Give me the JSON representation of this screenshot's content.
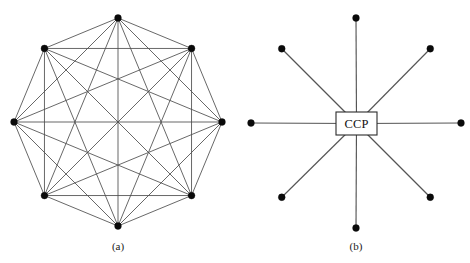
{
  "figure": {
    "width": 470,
    "height": 263,
    "background_color": "#ffffff",
    "edge_color": "#4d4d4d",
    "node_color": "#0a0a0a",
    "label_color": "#1a1a1a",
    "panels": [
      {
        "id": "panel-a",
        "caption": "(a)",
        "caption_x": 118,
        "caption_y": 247,
        "topology": "fully-connected-mesh",
        "center_x": 118,
        "center_y": 122,
        "radius": 104,
        "node_count": 8,
        "node_radius": 3.4,
        "start_angle_deg": -90,
        "edges": "all-pairs"
      },
      {
        "id": "panel-b",
        "caption": "(b)",
        "caption_x": 356,
        "caption_y": 247,
        "topology": "star-hub-and-spoke",
        "center_x": 356,
        "center_y": 123,
        "radius": 105,
        "node_count": 8,
        "node_radius": 3.4,
        "start_angle_deg": -90,
        "hub": {
          "label": "CCP",
          "x": 336,
          "y": 112,
          "width": 41,
          "height": 23
        }
      }
    ]
  },
  "chart_data": {
    "type": "diagram",
    "title": "",
    "subtitle": "",
    "panels": [
      {
        "name": "(a)",
        "description": "Fully connected mesh network of eight counterparties",
        "nodes": 8,
        "edges": 28,
        "node_labels": [
          "",
          "",
          "",
          "",
          "",
          "",
          "",
          ""
        ]
      },
      {
        "name": "(b)",
        "description": "Star network with a central counterparty clearing hub",
        "nodes": 8,
        "edges": 8,
        "hub_label": "CCP",
        "node_labels": [
          "",
          "",
          "",
          "",
          "",
          "",
          "",
          ""
        ]
      }
    ]
  }
}
